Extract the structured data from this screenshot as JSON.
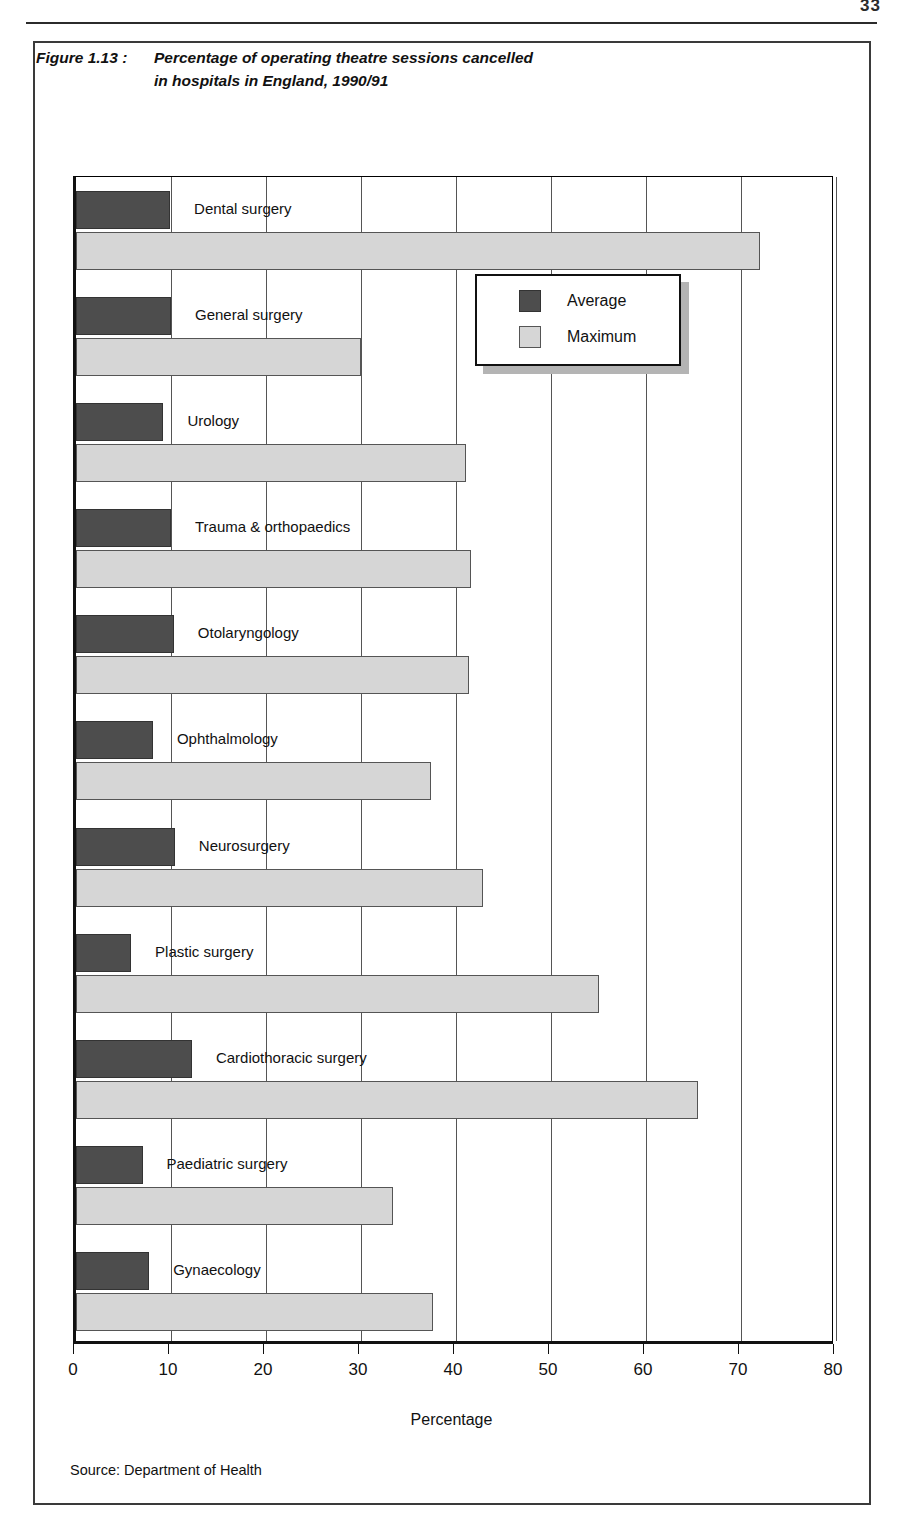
{
  "page": {
    "page_number": "33",
    "source_note": "Source: Department of Health"
  },
  "figure": {
    "label": "Figure 1.13 :",
    "title_line1": "Percentage of operating theatre sessions cancelled",
    "title_line2": "in hospitals in England, 1990/91"
  },
  "legend": {
    "position": "inside-right",
    "items": [
      {
        "label": "Average",
        "color": "#4d4d4d"
      },
      {
        "label": "Maximum",
        "color": "#d6d6d6"
      }
    ]
  },
  "colors": {
    "average": "#4d4d4d",
    "maximum": "#d6d6d6",
    "frame": "#3a3a3a",
    "gridline": "#555555"
  },
  "chart_data": {
    "type": "bar",
    "orientation": "horizontal",
    "xlabel": "Percentage",
    "ylabel": "",
    "xlim": [
      0,
      80
    ],
    "xticks": [
      0,
      10,
      20,
      30,
      40,
      50,
      60,
      70,
      80
    ],
    "xtick_labels": [
      "0",
      "10",
      "20",
      "30",
      "40",
      "50",
      "60",
      "70",
      "80"
    ],
    "grid": true,
    "grid_axis": "x",
    "legend_entries": [
      "Average",
      "Maximum"
    ],
    "categories": [
      "Dental surgery",
      "General surgery",
      "Urology",
      "Trauma & orthopaedics",
      "Otolaryngology",
      "Ophthalmology",
      "Neurosurgery",
      "Plastic surgery",
      "Cardiothoracic surgery",
      "Paediatric surgery",
      "Gynaecology"
    ],
    "series": [
      {
        "name": "Average",
        "color": "#4d4d4d",
        "values": [
          9.9,
          10.0,
          9.2,
          10.0,
          10.3,
          8.1,
          10.4,
          5.8,
          12.2,
          7.0,
          7.7
        ]
      },
      {
        "name": "Maximum",
        "color": "#d6d6d6",
        "values": [
          72.0,
          30.0,
          41.0,
          41.6,
          41.4,
          37.4,
          42.8,
          55.0,
          65.5,
          33.4,
          37.6
        ]
      }
    ],
    "source": "Department of Health"
  }
}
